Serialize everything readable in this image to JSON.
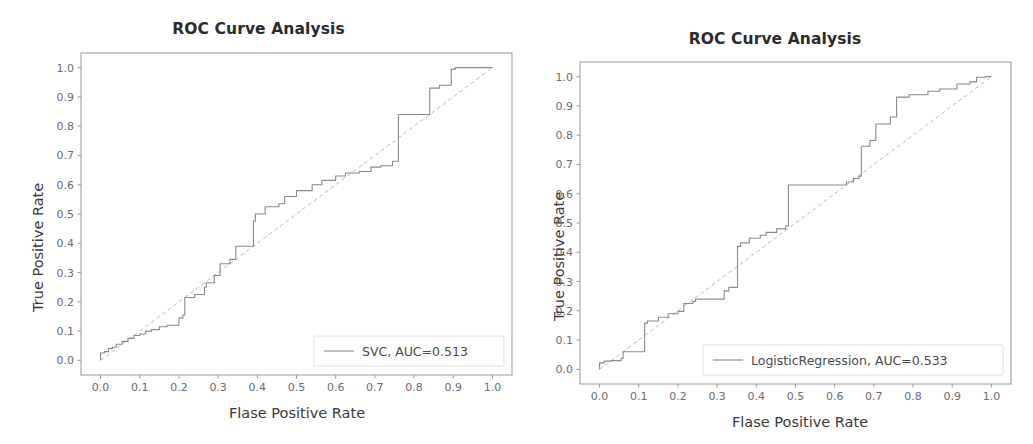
{
  "figure": {
    "background": "#ffffff",
    "width": 1033,
    "height": 444,
    "panel_count": 2
  },
  "chart_data": [
    {
      "id": "roc-svc",
      "type": "line",
      "title": "ROC Curve Analysis",
      "xlabel": "Flase Positive Rate",
      "ylabel": "True Positive Rate",
      "xlim": [
        -0.05,
        1.05
      ],
      "ylim": [
        -0.05,
        1.05
      ],
      "xticks": [
        "0.0",
        "0.1",
        "0.2",
        "0.3",
        "0.4",
        "0.5",
        "0.6",
        "0.7",
        "0.8",
        "0.9",
        "1.0"
      ],
      "yticks": [
        "0.0",
        "0.1",
        "0.2",
        "0.3",
        "0.4",
        "0.5",
        "0.6",
        "0.7",
        "0.8",
        "0.9",
        "1.0"
      ],
      "xtick_values": [
        0.0,
        0.1,
        0.2,
        0.3,
        0.4,
        0.5,
        0.6,
        0.7,
        0.8,
        0.9,
        1.0
      ],
      "ytick_values": [
        0.0,
        0.1,
        0.2,
        0.3,
        0.4,
        0.5,
        0.6,
        0.7,
        0.8,
        0.9,
        1.0
      ],
      "grid": false,
      "legend_position": "lower right",
      "legend_entries": [
        {
          "label": "SVC, AUC=0.513",
          "color": "#8a8a8a",
          "style": "solid"
        }
      ],
      "auc": 0.513,
      "model": "SVC",
      "chance_line": {
        "x": [
          0.0,
          1.0
        ],
        "y": [
          0.0,
          1.0
        ],
        "color": "#c9b3b8",
        "style": "dashed"
      },
      "series": [
        {
          "name": "SVC",
          "color": "#8a8a8a",
          "x": [
            0.0,
            0.0,
            0.01,
            0.01,
            0.02,
            0.02,
            0.03,
            0.03,
            0.04,
            0.04,
            0.055,
            0.055,
            0.07,
            0.07,
            0.085,
            0.085,
            0.1,
            0.1,
            0.115,
            0.115,
            0.13,
            0.13,
            0.15,
            0.15,
            0.17,
            0.17,
            0.2,
            0.2,
            0.21,
            0.21,
            0.215,
            0.215,
            0.24,
            0.24,
            0.265,
            0.265,
            0.27,
            0.27,
            0.29,
            0.29,
            0.305,
            0.305,
            0.33,
            0.33,
            0.345,
            0.345,
            0.39,
            0.39,
            0.395,
            0.395,
            0.42,
            0.42,
            0.455,
            0.455,
            0.47,
            0.47,
            0.5,
            0.5,
            0.54,
            0.54,
            0.565,
            0.565,
            0.6,
            0.6,
            0.625,
            0.625,
            0.66,
            0.66,
            0.69,
            0.69,
            0.715,
            0.715,
            0.745,
            0.745,
            0.76,
            0.76,
            0.84,
            0.84,
            0.865,
            0.865,
            0.895,
            0.895,
            0.905,
            0.905,
            0.985,
            0.985,
            1.0
          ],
          "y": [
            0.0,
            0.025,
            0.025,
            0.03,
            0.03,
            0.04,
            0.04,
            0.045,
            0.045,
            0.055,
            0.055,
            0.065,
            0.065,
            0.075,
            0.075,
            0.085,
            0.085,
            0.09,
            0.09,
            0.1,
            0.1,
            0.105,
            0.105,
            0.115,
            0.115,
            0.12,
            0.12,
            0.145,
            0.145,
            0.155,
            0.155,
            0.215,
            0.215,
            0.225,
            0.225,
            0.25,
            0.25,
            0.265,
            0.265,
            0.29,
            0.29,
            0.33,
            0.33,
            0.345,
            0.345,
            0.39,
            0.39,
            0.475,
            0.475,
            0.5,
            0.5,
            0.525,
            0.525,
            0.535,
            0.535,
            0.56,
            0.56,
            0.58,
            0.58,
            0.6,
            0.6,
            0.615,
            0.615,
            0.63,
            0.63,
            0.64,
            0.64,
            0.645,
            0.645,
            0.66,
            0.66,
            0.665,
            0.665,
            0.68,
            0.68,
            0.84,
            0.84,
            0.93,
            0.93,
            0.94,
            0.94,
            0.995,
            0.995,
            1.0,
            1.0,
            1.0,
            1.0
          ]
        }
      ]
    },
    {
      "id": "roc-logisticregression",
      "type": "line",
      "title": "ROC Curve Analysis",
      "xlabel": "Flase Positive Rate",
      "ylabel": "True Positive Rate",
      "xlim": [
        -0.05,
        1.05
      ],
      "ylim": [
        -0.05,
        1.05
      ],
      "xticks": [
        "0.0",
        "0.1",
        "0.2",
        "0.3",
        "0.4",
        "0.5",
        "0.6",
        "0.7",
        "0.8",
        "0.9",
        "1.0"
      ],
      "yticks": [
        "0.0",
        "0.1",
        "0.2",
        "0.3",
        "0.4",
        "0.5",
        "0.6",
        "0.7",
        "0.8",
        "0.9",
        "1.0"
      ],
      "xtick_values": [
        0.0,
        0.1,
        0.2,
        0.3,
        0.4,
        0.5,
        0.6,
        0.7,
        0.8,
        0.9,
        1.0
      ],
      "ytick_values": [
        0.0,
        0.1,
        0.2,
        0.3,
        0.4,
        0.5,
        0.6,
        0.7,
        0.8,
        0.9,
        1.0
      ],
      "grid": false,
      "legend_position": "lower right",
      "legend_entries": [
        {
          "label": "LogisticRegression, AUC=0.533",
          "color": "#8a8a8a",
          "style": "solid"
        }
      ],
      "auc": 0.533,
      "model": "LogisticRegression",
      "chance_line": {
        "x": [
          0.0,
          1.0
        ],
        "y": [
          0.0,
          1.0
        ],
        "color": "#c9b3b8",
        "style": "dashed"
      },
      "series": [
        {
          "name": "LogisticRegression",
          "color": "#8a8a8a",
          "x": [
            0.0,
            0.0,
            0.012,
            0.012,
            0.03,
            0.03,
            0.055,
            0.055,
            0.06,
            0.06,
            0.115,
            0.115,
            0.122,
            0.122,
            0.15,
            0.15,
            0.175,
            0.175,
            0.2,
            0.2,
            0.215,
            0.215,
            0.238,
            0.238,
            0.245,
            0.245,
            0.318,
            0.318,
            0.33,
            0.33,
            0.352,
            0.352,
            0.36,
            0.36,
            0.382,
            0.382,
            0.41,
            0.41,
            0.425,
            0.425,
            0.452,
            0.452,
            0.475,
            0.475,
            0.482,
            0.482,
            0.63,
            0.63,
            0.648,
            0.648,
            0.662,
            0.662,
            0.668,
            0.668,
            0.69,
            0.69,
            0.705,
            0.705,
            0.742,
            0.742,
            0.758,
            0.758,
            0.79,
            0.79,
            0.838,
            0.838,
            0.868,
            0.868,
            0.912,
            0.912,
            0.945,
            0.945,
            0.962,
            0.962,
            0.985,
            0.985,
            1.0
          ],
          "y": [
            0.0,
            0.022,
            0.022,
            0.028,
            0.028,
            0.03,
            0.03,
            0.038,
            0.038,
            0.06,
            0.06,
            0.158,
            0.158,
            0.165,
            0.165,
            0.178,
            0.178,
            0.19,
            0.19,
            0.198,
            0.198,
            0.225,
            0.225,
            0.232,
            0.232,
            0.24,
            0.24,
            0.268,
            0.268,
            0.28,
            0.28,
            0.42,
            0.42,
            0.432,
            0.432,
            0.448,
            0.448,
            0.458,
            0.458,
            0.468,
            0.468,
            0.48,
            0.48,
            0.49,
            0.49,
            0.63,
            0.63,
            0.64,
            0.64,
            0.652,
            0.652,
            0.66,
            0.66,
            0.762,
            0.762,
            0.782,
            0.782,
            0.838,
            0.838,
            0.862,
            0.862,
            0.93,
            0.93,
            0.938,
            0.938,
            0.95,
            0.95,
            0.958,
            0.958,
            0.975,
            0.975,
            0.982,
            0.982,
            0.998,
            0.998,
            1.0,
            1.0
          ]
        }
      ]
    }
  ]
}
